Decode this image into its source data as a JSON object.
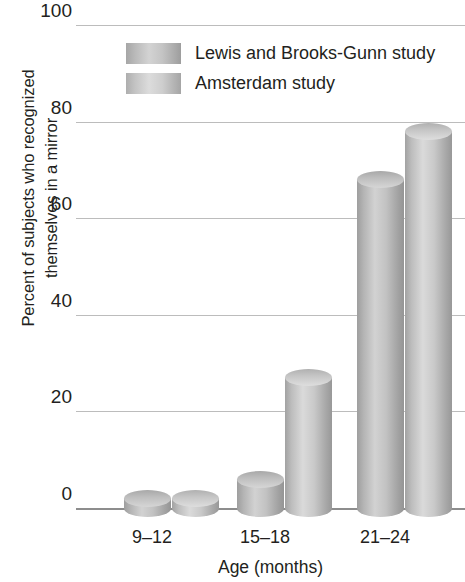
{
  "chart_data": {
    "type": "bar",
    "title": "",
    "subtitle": "",
    "xlabel": "Age (months)",
    "ylabel": "Percent of subjects who recognized themselves in a mirror",
    "ylabel_lines": [
      "Percent of subjects who recognized",
      "themselves in a mirror"
    ],
    "categories": [
      "9–12",
      "15–18",
      "21–24"
    ],
    "series": [
      {
        "name": "Lewis and Brooks-Gunn study",
        "values": [
          2,
          6,
          68
        ]
      },
      {
        "name": "Amsterdam study",
        "values": [
          2,
          27,
          78
        ]
      }
    ],
    "ylim": [
      0,
      100
    ],
    "yticks": [
      0,
      20,
      40,
      60,
      80,
      100
    ],
    "ytick_labels": [
      "0",
      "20",
      "40",
      "60",
      "80",
      "100"
    ],
    "grid": true,
    "legend_position": "top-left-inside",
    "colors": {
      "series_a": "#b8b8b8",
      "series_b": "#c4c4c4",
      "gridline": "#bcbcbc",
      "axis": "#8d8d8d",
      "text": "#231f20",
      "background": "#ffffff"
    }
  },
  "legend": {
    "entries": [
      {
        "label": "Lewis and Brooks-Gunn study",
        "swatch": "series-a"
      },
      {
        "label": "Amsterdam study",
        "swatch": "series-b"
      }
    ]
  },
  "axes": {
    "x_title": "Age (months)",
    "y_title_line1": "Percent of subjects who recognized",
    "y_title_line2": "themselves in a mirror",
    "y_tick_labels": [
      "100",
      "80",
      "60",
      "40",
      "20",
      "0"
    ],
    "x_tick_labels": [
      "9–12",
      "15–18",
      "21–24"
    ]
  }
}
